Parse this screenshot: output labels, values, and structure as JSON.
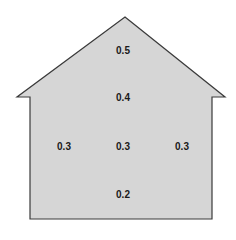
{
  "diagram": {
    "shape": "house",
    "fill_color": "#d6d6d6",
    "stroke_color": "#3a3a3a",
    "labels": [
      {
        "text": "0.5",
        "x": 123,
        "y": 50
      },
      {
        "text": "0.4",
        "x": 123,
        "y": 97
      },
      {
        "text": "0.3",
        "x": 64,
        "y": 146
      },
      {
        "text": "0.3",
        "x": 123,
        "y": 146
      },
      {
        "text": "0.3",
        "x": 182,
        "y": 146
      },
      {
        "text": "0.2",
        "x": 123,
        "y": 194
      }
    ]
  }
}
